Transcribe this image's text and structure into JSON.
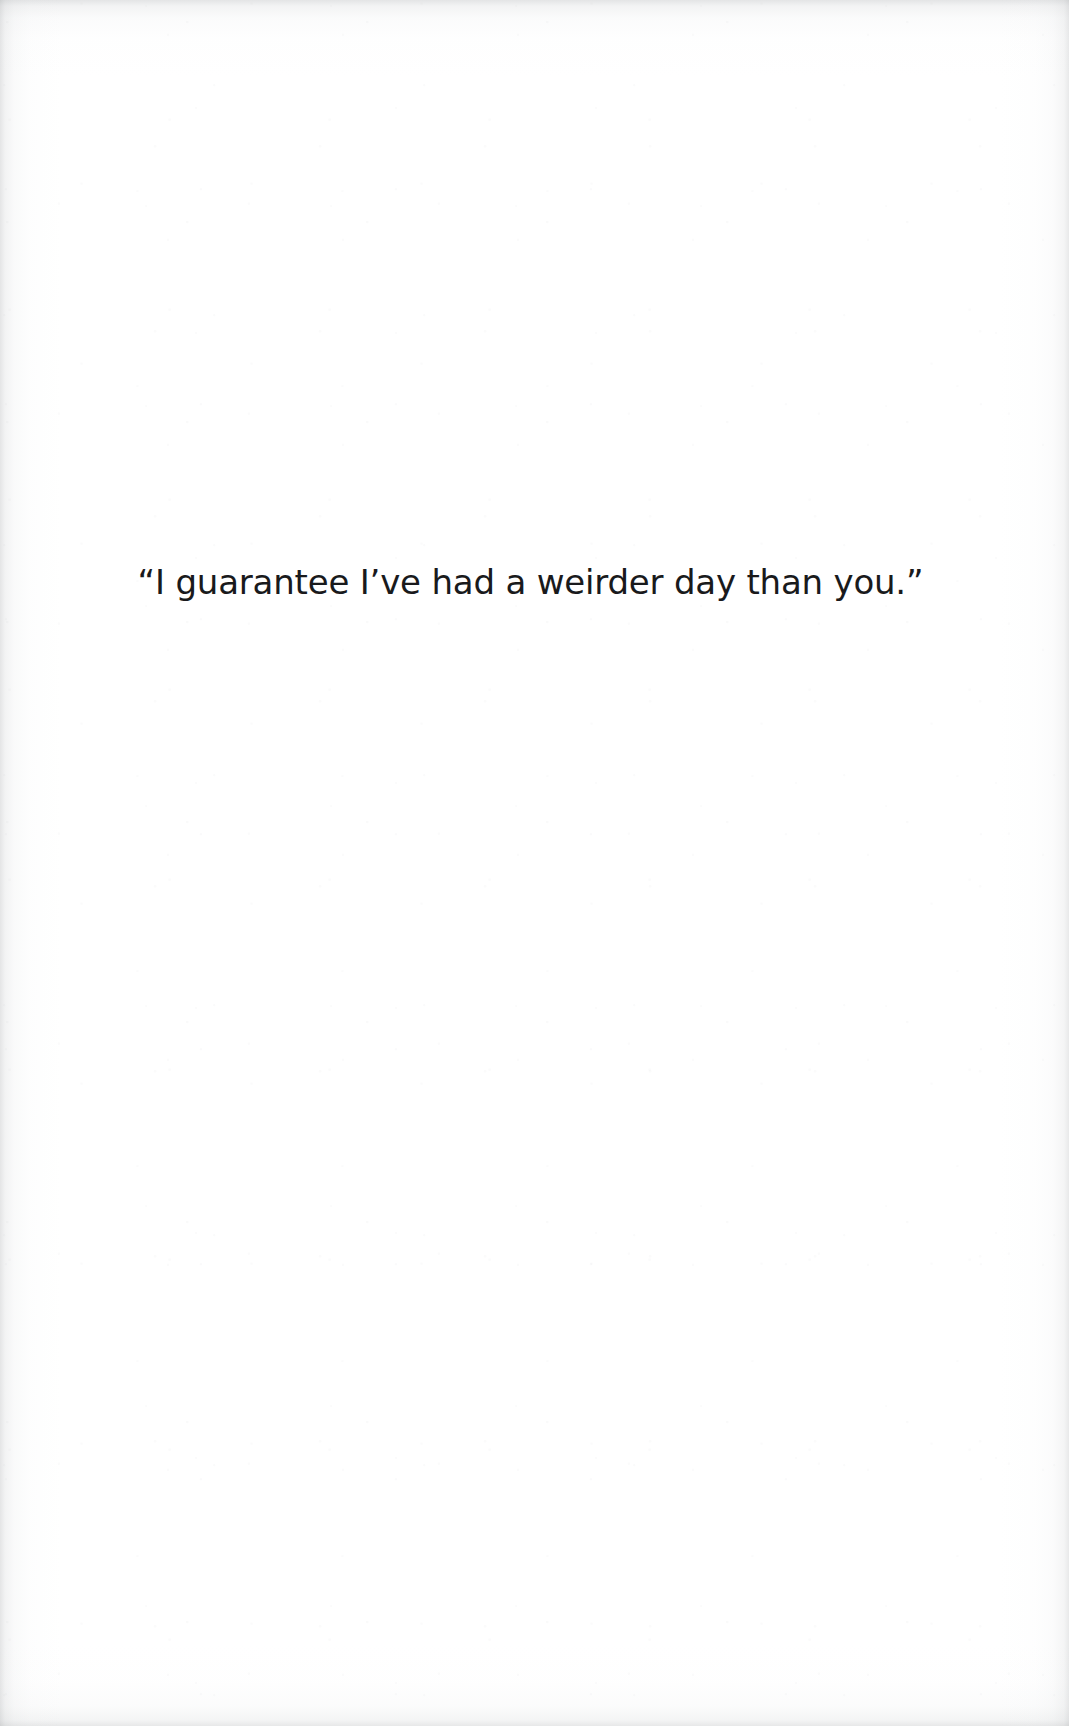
{
  "page": {
    "kind": "epigraph-page",
    "width": 1069,
    "height": 1726,
    "background_color": "#ffffff",
    "text_color": "#191a1c",
    "edge_shadow_color": "#8a8e92"
  },
  "epigraph": {
    "quote": "“I guarantee I’ve had a weirder day than you.”",
    "plain_text": "I guarantee I've had a weirder day than you.",
    "opening_quote_glyph": "”",
    "closing_quote_glyph": "”",
    "apostrophe_glyph": "’",
    "alignment": "center"
  }
}
